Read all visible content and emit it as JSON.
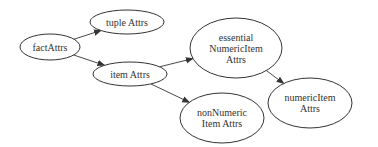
{
  "diagram": {
    "type": "directed-graph",
    "colors": {
      "stroke": "#333333",
      "fill": "#ffffff",
      "text": "#333333"
    },
    "nodes": [
      {
        "id": "factAttrs",
        "lines": [
          "factAttrs"
        ],
        "cx": 50,
        "cy": 47,
        "rx": 30,
        "ry": 13
      },
      {
        "id": "tupleAttrs",
        "lines": [
          "tuple Attrs"
        ],
        "cx": 127,
        "cy": 22,
        "rx": 37,
        "ry": 12
      },
      {
        "id": "itemAttrs",
        "lines": [
          "item Attrs"
        ],
        "cx": 130,
        "cy": 74,
        "rx": 37,
        "ry": 12
      },
      {
        "id": "essentialNumericItemAttrs",
        "lines": [
          "essential",
          "NumericItem",
          "Attrs"
        ],
        "cx": 236,
        "cy": 48,
        "rx": 46,
        "ry": 30
      },
      {
        "id": "numericItemAttrs",
        "lines": [
          "numericItem",
          "Attrs"
        ],
        "cx": 310,
        "cy": 103,
        "rx": 42,
        "ry": 25
      },
      {
        "id": "nonNumericItemAttrs",
        "lines": [
          "nonNumeric",
          "Item Attrs"
        ],
        "cx": 222,
        "cy": 118,
        "rx": 42,
        "ry": 25
      }
    ],
    "edges": [
      {
        "from": "factAttrs",
        "to": "tupleAttrs"
      },
      {
        "from": "factAttrs",
        "to": "itemAttrs"
      },
      {
        "from": "itemAttrs",
        "to": "essentialNumericItemAttrs"
      },
      {
        "from": "itemAttrs",
        "to": "nonNumericItemAttrs"
      },
      {
        "from": "essentialNumericItemAttrs",
        "to": "numericItemAttrs"
      }
    ]
  }
}
